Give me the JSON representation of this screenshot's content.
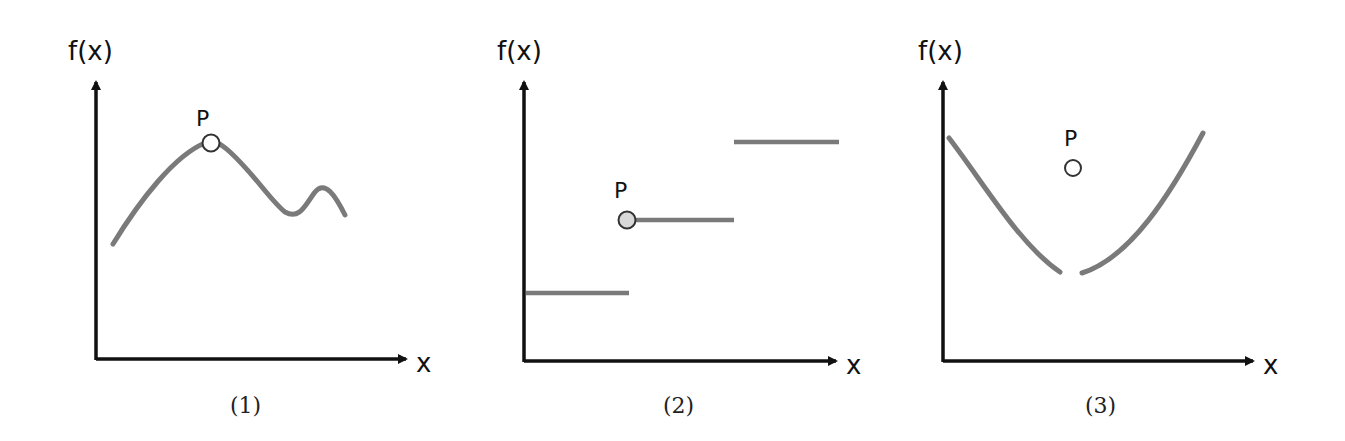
{
  "colors": {
    "axis": "#111111",
    "curve": "#7a7a7a",
    "point_stroke": "#333333",
    "point_fill": "#ffffff",
    "point_fill_panel2": "#d8d8d8"
  },
  "panels": [
    {
      "y_label": "f(x)",
      "x_label": "x",
      "point_label": "P",
      "caption": "(1)",
      "description": "Continuous curve with P on a local maximum"
    },
    {
      "y_label": "f(x)",
      "x_label": "x",
      "point_label": "P",
      "caption": "(2)",
      "description": "Step function with jump discontinuity; P marked with an open circle at the start of the middle step"
    },
    {
      "y_label": "f(x)",
      "x_label": "x",
      "point_label": "P",
      "caption": "(3)",
      "description": "U-shaped curve with a removable gap at the bottom; P is an isolated point above the gap"
    }
  ]
}
